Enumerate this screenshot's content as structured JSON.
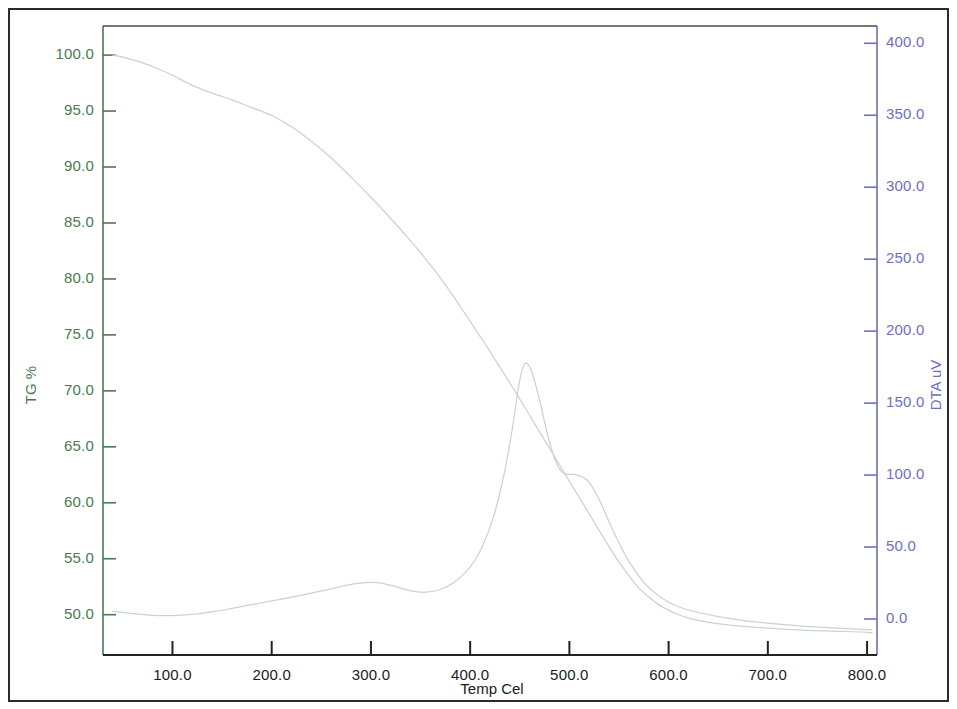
{
  "chart_data": {
    "type": "line",
    "title": "",
    "xlabel": "Temp Cel",
    "xlim": [
      30,
      810
    ],
    "xticks": [
      100,
      200,
      300,
      400,
      500,
      600,
      700,
      800
    ],
    "xticklabels": [
      "100.0",
      "200.0",
      "300.0",
      "400.0",
      "500.0",
      "600.0",
      "700.0",
      "800.0"
    ],
    "grid": false,
    "legend": "none",
    "axes": [
      {
        "id": "left",
        "label": "TG %",
        "color": "#4a7a55",
        "lim": [
          46.4,
          102.6
        ],
        "ticks": [
          50,
          55,
          60,
          65,
          70,
          75,
          80,
          85,
          90,
          95,
          100
        ],
        "ticklabels": [
          "50.0",
          "55.0",
          "60.0",
          "65.0",
          "70.0",
          "75.0",
          "80.0",
          "85.0",
          "90.0",
          "95.0",
          "100.0"
        ]
      },
      {
        "id": "right",
        "label": "DTA uV",
        "color": "#6f6fc0",
        "lim": [
          -25,
          412
        ],
        "ticks": [
          0,
          50,
          100,
          150,
          200,
          250,
          300,
          350,
          400
        ],
        "ticklabels": [
          "0.0",
          "50.0",
          "100.0",
          "150.0",
          "200.0",
          "250.0",
          "300.0",
          "350.0",
          "400.0"
        ]
      }
    ],
    "series": [
      {
        "name": "TG",
        "axis": "left",
        "color": "#c9d3d0",
        "unit": "%",
        "x": [
          40,
          55,
          70,
          85,
          100,
          120,
          140,
          160,
          180,
          200,
          220,
          240,
          260,
          280,
          300,
          320,
          340,
          355,
          370,
          385,
          400,
          415,
          430,
          445,
          460,
          475,
          490,
          505,
          520,
          535,
          550,
          570,
          590,
          610,
          630,
          660,
          700,
          740,
          780,
          805
        ],
        "y": [
          100.0,
          99.7,
          99.3,
          98.8,
          98.2,
          97.3,
          96.6,
          96.0,
          95.3,
          94.6,
          93.6,
          92.3,
          90.8,
          89.1,
          87.3,
          85.4,
          83.4,
          81.8,
          80.1,
          78.2,
          76.2,
          74.2,
          72.1,
          70.0,
          67.8,
          65.6,
          63.4,
          61.2,
          59.0,
          56.8,
          54.7,
          52.4,
          50.9,
          50.0,
          49.5,
          49.1,
          48.8,
          48.6,
          48.5,
          48.4
        ]
      },
      {
        "name": "DTA",
        "axis": "right",
        "color": "#c9d3d0",
        "unit": "uV",
        "x": [
          40,
          60,
          80,
          100,
          120,
          140,
          160,
          180,
          200,
          220,
          240,
          260,
          280,
          295,
          310,
          325,
          340,
          355,
          370,
          385,
          400,
          412,
          424,
          434,
          442,
          448,
          452,
          456,
          462,
          470,
          478,
          486,
          492,
          498,
          504,
          512,
          520,
          530,
          545,
          560,
          575,
          590,
          610,
          640,
          680,
          720,
          760,
          805
        ],
        "y": [
          5.5,
          3.8,
          2.6,
          2.4,
          3.2,
          5.0,
          7.4,
          10.0,
          12.6,
          15.2,
          18.0,
          21.0,
          24.0,
          25.3,
          25.0,
          22.5,
          19.5,
          18.6,
          20.5,
          26.0,
          36.0,
          50.0,
          72.0,
          100.0,
          130.0,
          158.0,
          172.0,
          178.0,
          172.0,
          152.0,
          128.0,
          110.0,
          102.5,
          100.5,
          100.5,
          99.0,
          95.0,
          83.0,
          60.0,
          40.0,
          25.5,
          16.0,
          8.5,
          3.0,
          -1.5,
          -4.0,
          -6.0,
          -7.5
        ]
      }
    ],
    "annotations": [
      {
        "name": "dta-main-peak",
        "x": 456,
        "y": 178,
        "axis": "right"
      },
      {
        "name": "dta-shoulder-peak",
        "x": 500,
        "y": 101,
        "axis": "right"
      },
      {
        "name": "dta-broad-bump",
        "x": 295,
        "y": 25.3,
        "axis": "right"
      },
      {
        "name": "tg-onset",
        "x": 40,
        "y": 100.0,
        "axis": "left"
      },
      {
        "name": "tg-final-residue",
        "x": 805,
        "y": 48.4,
        "axis": "left"
      }
    ]
  },
  "geometry": {
    "plot_left": 103,
    "plot_right": 877,
    "plot_top": 26,
    "plot_bottom": 655
  }
}
